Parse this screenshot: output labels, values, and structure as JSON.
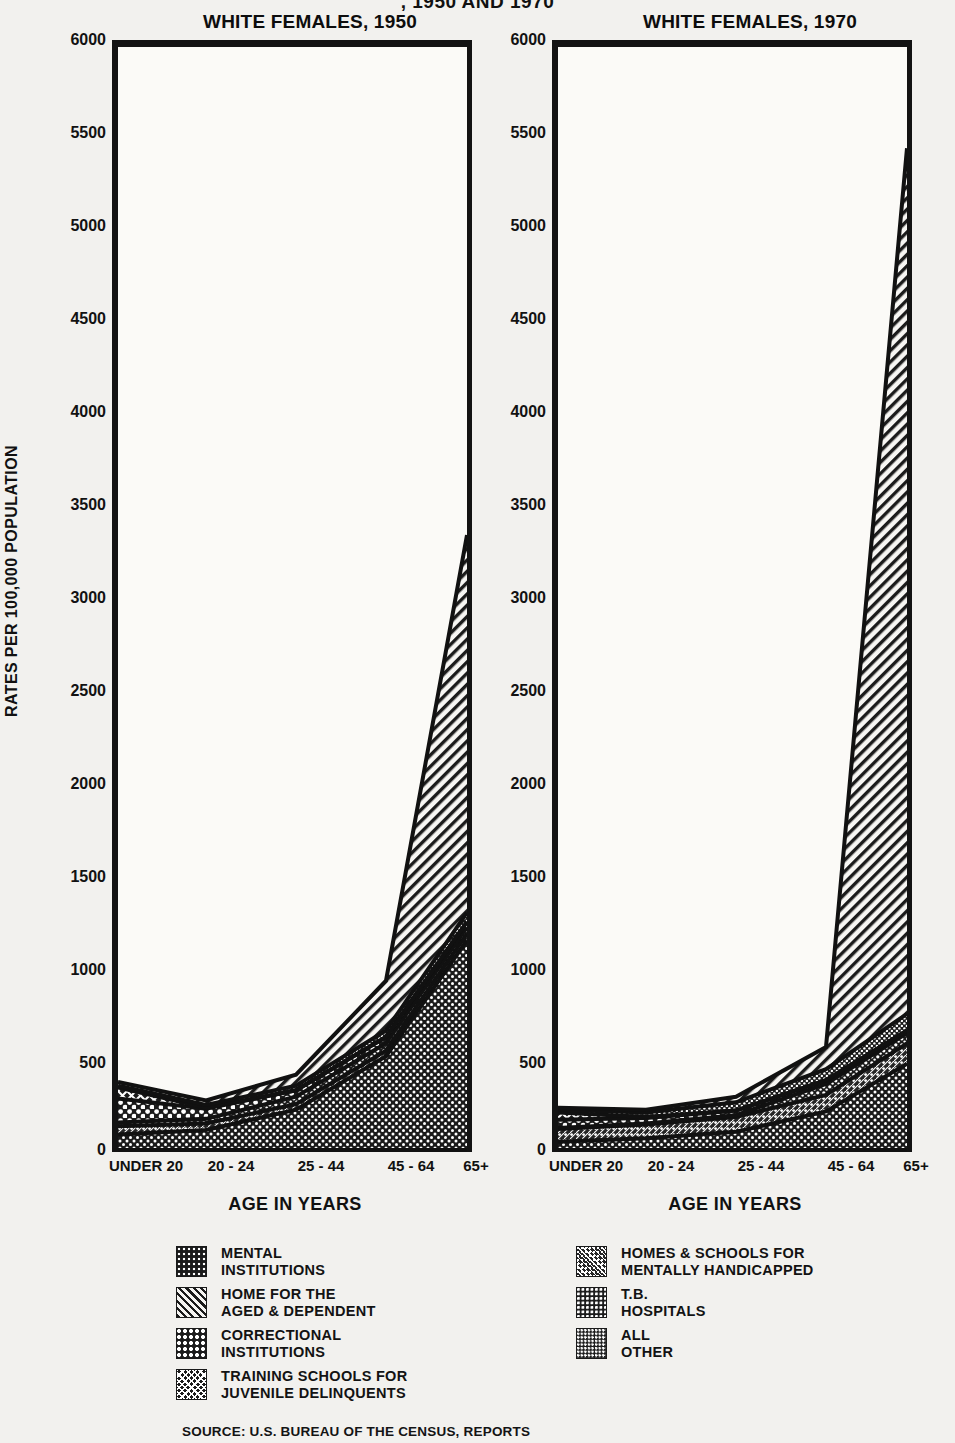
{
  "main_title": ", 1950 AND 1970",
  "y_axis_title": "RATES PER 100,000 POPULATION",
  "age_caption": "AGE IN YEARS",
  "source_note": "SOURCE: U.S. BUREAU OF THE CENSUS, REPORTS",
  "panels": [
    {
      "id": "left",
      "title": "WHITE FEMALES, 1950"
    },
    {
      "id": "right",
      "title": "WHITE FEMALES, 1970"
    }
  ],
  "legend": {
    "left_column": [
      {
        "key": "mental",
        "swatch": "pat-mental",
        "label": "MENTAL\nINSTITUTIONS"
      },
      {
        "key": "aged",
        "swatch": "pat-aged",
        "label": "HOME FOR THE\nAGED & DEPENDENT"
      },
      {
        "key": "correctional",
        "swatch": "pat-correctional",
        "label": "CORRECTIONAL\nINSTITUTIONS"
      },
      {
        "key": "training",
        "swatch": "pat-training",
        "label": "TRAINING SCHOOLS FOR\nJUVENILE DELINQUENTS"
      }
    ],
    "right_column": [
      {
        "key": "handicapped",
        "swatch": "pat-handicapped",
        "label": "HOMES & SCHOOLS FOR\nMENTALLY HANDICAPPED"
      },
      {
        "key": "tb",
        "swatch": "pat-tb",
        "label": "T.B.\nHOSPITALS"
      },
      {
        "key": "allother",
        "swatch": "pat-allother",
        "label": "ALL\nOTHER"
      }
    ]
  },
  "chart_data": {
    "type": "area",
    "xlabel": "AGE IN YEARS",
    "ylabel": "RATES PER 100,000 POPULATION",
    "ylim": [
      0,
      6000
    ],
    "yticks": [
      0,
      500,
      1000,
      1500,
      2000,
      2500,
      3000,
      3500,
      4000,
      4500,
      5000,
      5500,
      6000
    ],
    "grid": false,
    "legend_position": "bottom",
    "categories": [
      "UNDER 20",
      "20 - 24",
      "25 - 44",
      "45 - 64",
      "65+"
    ],
    "stacked": true,
    "panels": [
      {
        "name": "WHITE FEMALES, 1950",
        "series": [
          {
            "name": "MENTAL INSTITUTIONS",
            "values": [
              95,
              120,
              230,
              520,
              1150
            ]
          },
          {
            "name": "HOME FOR THE AGED & DEPENDENT",
            "values": [
              20,
              25,
              60,
              270,
              2050
            ]
          },
          {
            "name": "CORRECTIONAL INSTITUTIONS",
            "values": [
              130,
              55,
              35,
              35,
              30
            ]
          },
          {
            "name": "TRAINING SCHOOLS FOR JUVENILE DELINQUENTS",
            "values": [
              60,
              5,
              0,
              0,
              0
            ]
          },
          {
            "name": "HOMES & SCHOOLS FOR MENTALLY HANDICAPPED",
            "values": [
              45,
              35,
              30,
              30,
              35
            ]
          },
          {
            "name": "T.B. HOSPITALS",
            "values": [
              20,
              25,
              40,
              40,
              35
            ]
          },
          {
            "name": "ALL OTHER",
            "values": [
              10,
              15,
              25,
              35,
              50
            ]
          }
        ],
        "totals": [
          380,
          280,
          420,
          930,
          3350
        ]
      },
      {
        "name": "WHITE FEMALES, 1970",
        "series": [
          {
            "name": "MENTAL INSTITUTIONS",
            "values": [
              55,
              75,
              110,
              220,
              480
            ]
          },
          {
            "name": "HOME FOR THE AGED & DEPENDENT",
            "values": [
              10,
              15,
              30,
              120,
              4700
            ]
          },
          {
            "name": "CORRECTIONAL INSTITUTIONS",
            "values": [
              45,
              30,
              25,
              20,
              15
            ]
          },
          {
            "name": "TRAINING SCHOOLS FOR JUVENILE DELINQUENTS",
            "values": [
              40,
              5,
              0,
              0,
              0
            ]
          },
          {
            "name": "HOMES & SCHOOLS FOR MENTALLY HANDICAPPED",
            "values": [
              70,
              75,
              80,
              90,
              110
            ]
          },
          {
            "name": "T.B. HOSPITALS",
            "values": [
              5,
              5,
              10,
              60,
              55
            ]
          },
          {
            "name": "ALL OTHER",
            "values": [
              15,
              25,
              45,
              60,
              90
            ]
          }
        ],
        "totals": [
          240,
          230,
          300,
          570,
          5450
        ]
      }
    ]
  },
  "yticks_render": [
    {
      "value": "6000",
      "top": 31
    },
    {
      "value": "5500",
      "top": 124
    },
    {
      "value": "5000",
      "top": 217
    },
    {
      "value": "4500",
      "top": 310
    },
    {
      "value": "4000",
      "top": 403
    },
    {
      "value": "3500",
      "top": 496
    },
    {
      "value": "3000",
      "top": 589
    },
    {
      "value": "2500",
      "top": 682
    },
    {
      "value": "2000",
      "top": 775
    },
    {
      "value": "1500",
      "top": 868
    },
    {
      "value": "1000",
      "top": 961
    },
    {
      "value": "500",
      "top": 1054
    },
    {
      "value": "0",
      "top": 1141
    }
  ],
  "xticks_render": [
    {
      "label": "UNDER 20",
      "left_panel_x": 28,
      "right_panel_x": 28
    },
    {
      "label": "20 - 24",
      "left_panel_x": 118,
      "right_panel_x": 118
    },
    {
      "label": "25 - 44",
      "left_panel_x": 208,
      "right_panel_x": 208
    },
    {
      "label": "45 - 64",
      "left_panel_x": 298,
      "right_panel_x": 298
    },
    {
      "label": "65+",
      "left_panel_x": 378,
      "right_panel_x": 378
    }
  ]
}
